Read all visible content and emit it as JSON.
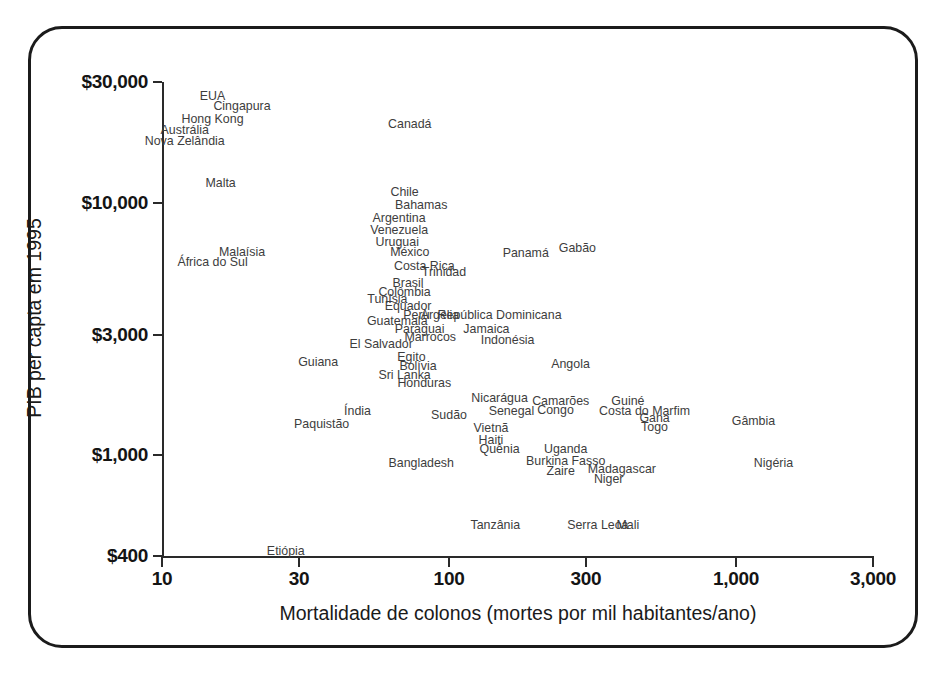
{
  "chart_data": {
    "type": "scatter",
    "title": "",
    "subtitle": "",
    "xlabel": "Mortalidade de colonos (mortes por mil habitantes/ano)",
    "ylabel": "PIB per capta em 1995",
    "xscale": "log",
    "yscale": "log",
    "xlim": [
      10,
      3000
    ],
    "ylim": [
      400,
      30000
    ],
    "grid": false,
    "legend": null,
    "x_ticks": [
      {
        "value": 10,
        "label": "10"
      },
      {
        "value": 30,
        "label": "30"
      },
      {
        "value": 100,
        "label": "100"
      },
      {
        "value": 300,
        "label": "300"
      },
      {
        "value": 1000,
        "label": "1,000"
      },
      {
        "value": 3000,
        "label": "3,000"
      }
    ],
    "y_ticks": [
      {
        "value": 30000,
        "label": "$30,000"
      },
      {
        "value": 10000,
        "label": "$10,000"
      },
      {
        "value": 3000,
        "label": "$3,000"
      },
      {
        "value": 1000,
        "label": "$1,000"
      },
      {
        "value": 400,
        "label": "$400"
      }
    ],
    "marker_style": "text-label",
    "points": [
      {
        "label": "EUA",
        "x": 15,
        "y": 26500
      },
      {
        "label": "Cingapura",
        "x": 19,
        "y": 24000
      },
      {
        "label": "Hong Kong",
        "x": 15,
        "y": 21500
      },
      {
        "label": "Austrália",
        "x": 12,
        "y": 19300
      },
      {
        "label": "Nova Zelândia",
        "x": 12,
        "y": 17500
      },
      {
        "label": "Malta",
        "x": 16,
        "y": 12000
      },
      {
        "label": "Canadá",
        "x": 73,
        "y": 20500
      },
      {
        "label": "Chile",
        "x": 70,
        "y": 11000
      },
      {
        "label": "Bahamas",
        "x": 80,
        "y": 9800
      },
      {
        "label": "Argentina",
        "x": 67,
        "y": 8700
      },
      {
        "label": "Venezuela",
        "x": 67,
        "y": 7800
      },
      {
        "label": "Uruguai",
        "x": 66,
        "y": 7000
      },
      {
        "label": "México",
        "x": 73,
        "y": 6400
      },
      {
        "label": "Malaísia",
        "x": 19,
        "y": 6400
      },
      {
        "label": "África do Sul",
        "x": 15,
        "y": 5800
      },
      {
        "label": "Costa Rica",
        "x": 82,
        "y": 5600
      },
      {
        "label": "Trinidad",
        "x": 96,
        "y": 5300
      },
      {
        "label": "Brasil",
        "x": 72,
        "y": 4800
      },
      {
        "label": "Colômbia",
        "x": 70,
        "y": 4450
      },
      {
        "label": "Tunísia",
        "x": 61,
        "y": 4150
      },
      {
        "label": "Equador",
        "x": 72,
        "y": 3900
      },
      {
        "label": "Peru",
        "x": 77,
        "y": 3600
      },
      {
        "label": "Argélia",
        "x": 93,
        "y": 3600
      },
      {
        "label": "República Dominicana",
        "x": 150,
        "y": 3600
      },
      {
        "label": "Guatemala",
        "x": 66,
        "y": 3400
      },
      {
        "label": "Paraguai",
        "x": 79,
        "y": 3150
      },
      {
        "label": "Jamaica",
        "x": 135,
        "y": 3150
      },
      {
        "label": "Marrocos",
        "x": 86,
        "y": 2950
      },
      {
        "label": "Indonésia",
        "x": 160,
        "y": 2850
      },
      {
        "label": "El Salvador",
        "x": 58,
        "y": 2750
      },
      {
        "label": "Panamá",
        "x": 185,
        "y": 6300
      },
      {
        "label": "Gabão",
        "x": 280,
        "y": 6600
      },
      {
        "label": "Egito",
        "x": 74,
        "y": 2450
      },
      {
        "label": "Bolívia",
        "x": 78,
        "y": 2250
      },
      {
        "label": "Sri Lanka",
        "x": 70,
        "y": 2080
      },
      {
        "label": "Honduras",
        "x": 82,
        "y": 1930
      },
      {
        "label": "Guiana",
        "x": 35,
        "y": 2350
      },
      {
        "label": "Angola",
        "x": 265,
        "y": 2300
      },
      {
        "label": "Nicarágua",
        "x": 150,
        "y": 1680
      },
      {
        "label": "Camarões",
        "x": 245,
        "y": 1640
      },
      {
        "label": "Guiné",
        "x": 420,
        "y": 1640
      },
      {
        "label": "Senegal",
        "x": 165,
        "y": 1500
      },
      {
        "label": "Congo",
        "x": 235,
        "y": 1510
      },
      {
        "label": "Costa do Marfim",
        "x": 480,
        "y": 1500
      },
      {
        "label": "Índia",
        "x": 48,
        "y": 1500
      },
      {
        "label": "Sudão",
        "x": 100,
        "y": 1450
      },
      {
        "label": "Gana",
        "x": 520,
        "y": 1400
      },
      {
        "label": "Togo",
        "x": 520,
        "y": 1300
      },
      {
        "label": "Gâmbia",
        "x": 1150,
        "y": 1370
      },
      {
        "label": "Paquistão",
        "x": 36,
        "y": 1330
      },
      {
        "label": "Vietnã",
        "x": 140,
        "y": 1280
      },
      {
        "label": "Haiti",
        "x": 140,
        "y": 1150
      },
      {
        "label": "Quênia",
        "x": 150,
        "y": 1060
      },
      {
        "label": "Uganda",
        "x": 255,
        "y": 1060
      },
      {
        "label": "Bangladesh",
        "x": 80,
        "y": 930
      },
      {
        "label": "Burkina Fasso",
        "x": 255,
        "y": 950
      },
      {
        "label": "Zaire",
        "x": 245,
        "y": 870
      },
      {
        "label": "Madagascar",
        "x": 400,
        "y": 880
      },
      {
        "label": "Niger",
        "x": 360,
        "y": 810
      },
      {
        "label": "Nigéria",
        "x": 1350,
        "y": 930
      },
      {
        "label": "Tanzânia",
        "x": 145,
        "y": 530
      },
      {
        "label": "Serra Leoa",
        "x": 330,
        "y": 530
      },
      {
        "label": "Mali",
        "x": 420,
        "y": 530
      },
      {
        "label": "Etiópia",
        "x": 27,
        "y": 420
      }
    ]
  },
  "colors": {
    "frame": "#1b1b1b",
    "axis": "#2a2a2a",
    "tick_label": "#141414",
    "point_label": "#3d3d3d",
    "background": "#ffffff"
  }
}
